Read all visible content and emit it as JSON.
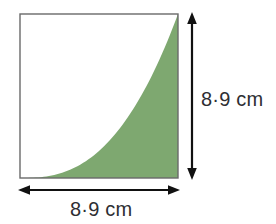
{
  "figure": {
    "background_color": "#ffffff",
    "square": {
      "name": "square-outline",
      "x": 20,
      "y": 14,
      "width": 158,
      "height": 164,
      "stroke_color": "#6a6a6a",
      "stroke_width": 1.4,
      "fill_color": "#ffffff"
    },
    "shaded_region": {
      "name": "shaded-curve-region",
      "fill_color": "#7ea870",
      "description": "convex curve from bottom-left corner to top-right corner",
      "curve_exponent": 2.6,
      "curve_points": [
        {
          "x_fraction": 0.0,
          "height_fraction": 0.0
        },
        {
          "x_fraction": 0.25,
          "height_fraction": 0.03
        },
        {
          "x_fraction": 0.5,
          "height_fraction": 0.17
        },
        {
          "x_fraction": 0.65,
          "height_fraction": 0.3
        },
        {
          "x_fraction": 0.8,
          "height_fraction": 0.49
        },
        {
          "x_fraction": 0.9,
          "height_fraction": 0.68
        },
        {
          "x_fraction": 1.0,
          "height_fraction": 1.0
        }
      ]
    },
    "arrows": {
      "color": "#111111",
      "stroke_width": 2.2,
      "height_arrow": {
        "name": "height-dimension-arrow",
        "orientation": "vertical",
        "x": 192,
        "y_start": 14,
        "y_end": 178,
        "double_headed": true
      },
      "width_arrow": {
        "name": "width-dimension-arrow",
        "orientation": "horizontal",
        "y": 190,
        "x_start": 20,
        "x_end": 178,
        "double_headed": true
      }
    },
    "labels": {
      "height": "8·9 cm",
      "width": "8·9 cm"
    }
  }
}
